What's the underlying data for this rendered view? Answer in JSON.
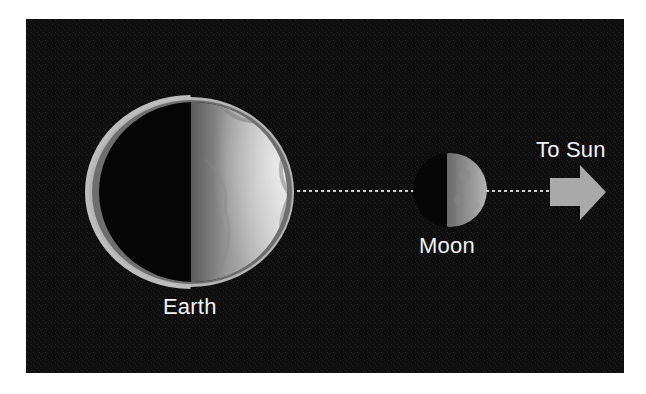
{
  "diagram": {
    "type": "earth-moon-sun-geometry",
    "labels": {
      "earth": "Earth",
      "moon": "Moon",
      "sun_direction": "To Sun"
    },
    "bodies": [
      {
        "name": "Earth",
        "phase": "half-lit (right side illuminated)"
      },
      {
        "name": "Moon",
        "phase": "half-lit (right side illuminated)"
      }
    ],
    "connectors": [
      {
        "from": "Earth",
        "to": "Moon",
        "style": "dotted"
      },
      {
        "from": "Moon",
        "to": "Sun arrow",
        "style": "dotted"
      }
    ],
    "arrow": {
      "direction": "right",
      "meaning": "To Sun"
    },
    "colors": {
      "background_panel": "#0d0d0d",
      "page": "#ffffff",
      "text": "#f2f2f2",
      "arrow": "#a9a9a9",
      "dotted_line": "#cfcfcf",
      "earth_rim": "#b8b8b8"
    }
  }
}
